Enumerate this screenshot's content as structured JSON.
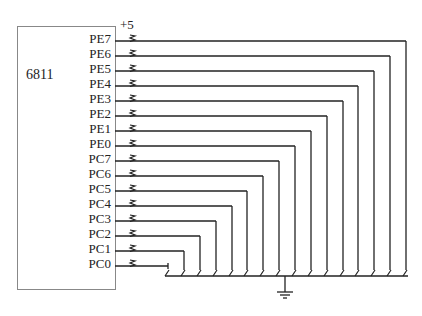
{
  "chip": {
    "name": "6811"
  },
  "supply": {
    "label": "+5"
  },
  "pins": [
    {
      "label": "PE7",
      "y": 41,
      "drop_x": 406
    },
    {
      "label": "PE6",
      "y": 56,
      "drop_x": 390
    },
    {
      "label": "PE5",
      "y": 71,
      "drop_x": 374
    },
    {
      "label": "PE4",
      "y": 86,
      "drop_x": 358
    },
    {
      "label": "PE3",
      "y": 101,
      "drop_x": 343
    },
    {
      "label": "PE2",
      "y": 116,
      "drop_x": 327
    },
    {
      "label": "PE1",
      "y": 131,
      "drop_x": 311
    },
    {
      "label": "PE0",
      "y": 146,
      "drop_x": 295
    },
    {
      "label": "PC7",
      "y": 161,
      "drop_x": 279
    },
    {
      "label": "PC6",
      "y": 176,
      "drop_x": 263
    },
    {
      "label": "PC5",
      "y": 191,
      "drop_x": 247
    },
    {
      "label": "PC4",
      "y": 206,
      "drop_x": 232
    },
    {
      "label": "PC3",
      "y": 221,
      "drop_x": 216
    },
    {
      "label": "PC2",
      "y": 236,
      "drop_x": 200
    },
    {
      "label": "PC1",
      "y": 251,
      "drop_x": 184
    },
    {
      "label": "PC0",
      "y": 266,
      "drop_x": 168
    }
  ],
  "colors": {
    "line": "#222222",
    "box": "#888888"
  }
}
